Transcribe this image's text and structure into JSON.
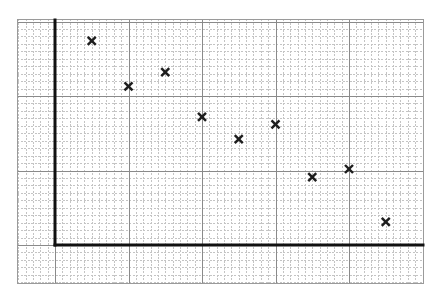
{
  "chart_data": {
    "type": "scatter",
    "title": "",
    "xlabel": "",
    "ylabel": "",
    "marker": "x",
    "x_tick_labels": [],
    "y_tick_labels": [],
    "grid": true,
    "grid_style": "graph paper: minor squares every 1 unit (dashed light gray), major lines every 10 units (solid gray)",
    "legend": null,
    "xlim": [
      -5,
      50
    ],
    "ylim": [
      -5,
      30.5
    ],
    "series": [
      {
        "name": "points",
        "x": [
          5,
          10,
          15,
          20,
          25,
          30,
          35,
          40,
          45
        ],
        "y": [
          27.4,
          21.3,
          23.2,
          17.2,
          14.2,
          16.2,
          9.1,
          10.2,
          3.1
        ]
      }
    ]
  },
  "layout": {
    "grid_left_px": 17,
    "grid_top_px": 19,
    "grid_right_px": 423,
    "grid_bottom_px": 283,
    "origin_x_px": 55,
    "origin_y_px": 245,
    "px_per_unit_x": 7.35,
    "px_per_unit_y": 7.45,
    "colors": {
      "minor_grid": "#c4c4c4",
      "major_grid": "#8a8a8a",
      "axis": "#111111",
      "marker": "#1e1e1e",
      "background": "#ffffff"
    }
  }
}
